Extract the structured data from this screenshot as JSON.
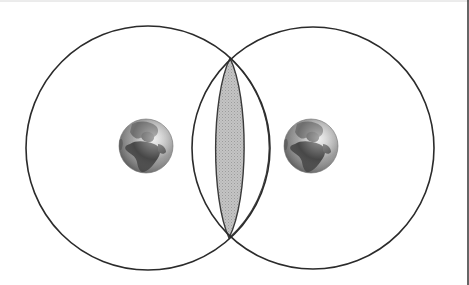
{
  "diagram": {
    "title": "Two globes with overlapping circular regions",
    "canvas": {
      "width": 469,
      "height": 285,
      "background": "#ffffff"
    },
    "frame": {
      "top_line": {
        "y": 1,
        "color": "#d8d8d8"
      },
      "right_line": {
        "x": 468,
        "color": "#333333"
      }
    },
    "circles": [
      {
        "id": "left-range",
        "cx": 148,
        "cy": 148,
        "r": 122,
        "stroke": "#2b2b2b",
        "stroke_width": 1.6
      },
      {
        "id": "right-range",
        "cx": 313,
        "cy": 148,
        "r": 121,
        "stroke": "#2b2b2b",
        "stroke_width": 1.6
      }
    ],
    "intersection": {
      "top": {
        "x": 230,
        "y": 58
      },
      "bottom": {
        "x": 229,
        "y": 238
      },
      "lens": {
        "left_x": 213,
        "right_x": 247,
        "fill": "#bdbdbd",
        "stroke": "#3a3a3a"
      },
      "outer_arc": {
        "apex_x": 268,
        "stroke": "#4a4a4a"
      }
    },
    "globes": [
      {
        "id": "left-globe",
        "cx": 146,
        "cy": 146,
        "r": 27,
        "label": "Earth"
      },
      {
        "id": "right-globe",
        "cx": 311,
        "cy": 146,
        "r": 27,
        "label": "Earth"
      }
    ],
    "colors": {
      "ocean_light": "#d9d9d9",
      "ocean_mid": "#9a9a9a",
      "ocean_dark": "#5e5e5e",
      "land": "#4a4a4a",
      "land_light": "#7a7a7a"
    }
  }
}
